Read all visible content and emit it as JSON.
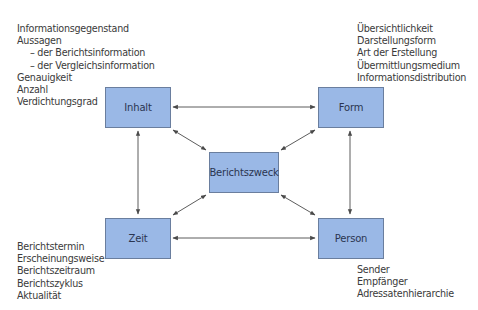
{
  "diagram": {
    "type": "relationship-diagram",
    "center": {
      "id": "berichtszweck",
      "label": "Berichtszweck"
    },
    "nodes": [
      {
        "id": "inhalt",
        "label": "Inhalt"
      },
      {
        "id": "form",
        "label": "Form"
      },
      {
        "id": "zeit",
        "label": "Zeit"
      },
      {
        "id": "person",
        "label": "Person"
      }
    ],
    "edges": [
      {
        "from": "inhalt",
        "to": "form",
        "direction": "both"
      },
      {
        "from": "zeit",
        "to": "person",
        "direction": "both"
      },
      {
        "from": "inhalt",
        "to": "zeit",
        "direction": "both"
      },
      {
        "from": "form",
        "to": "person",
        "direction": "both"
      },
      {
        "from": "berichtszweck",
        "to": "inhalt",
        "direction": "both"
      },
      {
        "from": "berichtszweck",
        "to": "form",
        "direction": "both"
      },
      {
        "from": "berichtszweck",
        "to": "zeit",
        "direction": "both"
      },
      {
        "from": "berichtszweck",
        "to": "person",
        "direction": "both"
      }
    ],
    "lists": {
      "inhalt": [
        {
          "text": "Informationsgegenstand",
          "indent": false
        },
        {
          "text": "Aussagen",
          "indent": false
        },
        {
          "text": "– der Berichtsinformation",
          "indent": true
        },
        {
          "text": "– der Vergleichsinformation",
          "indent": true
        },
        {
          "text": "Genauigkeit",
          "indent": false
        },
        {
          "text": "Anzahl",
          "indent": false
        },
        {
          "text": "Verdichtungsgrad",
          "indent": false
        }
      ],
      "form": [
        {
          "text": "Übersichtlichkeit"
        },
        {
          "text": "Darstellungsform"
        },
        {
          "text": "Art der Erstellung"
        },
        {
          "text": "Übermittlungsmedium"
        },
        {
          "text": "Informationsdistribution"
        }
      ],
      "zeit": [
        {
          "text": "Berichtstermin"
        },
        {
          "text": "Erscheinungsweise"
        },
        {
          "text": "Berichtszeitraum"
        },
        {
          "text": "Berichtszyklus"
        },
        {
          "text": "Aktualität"
        }
      ],
      "person": [
        {
          "text": "Sender"
        },
        {
          "text": "Empfänger"
        },
        {
          "text": "Adressatenhierarchie"
        }
      ]
    },
    "colors": {
      "box_fill": "#9ab8e6",
      "box_border": "#6a7e9e",
      "arrow": "#4a4a4a",
      "text": "#3a3a3a"
    }
  }
}
